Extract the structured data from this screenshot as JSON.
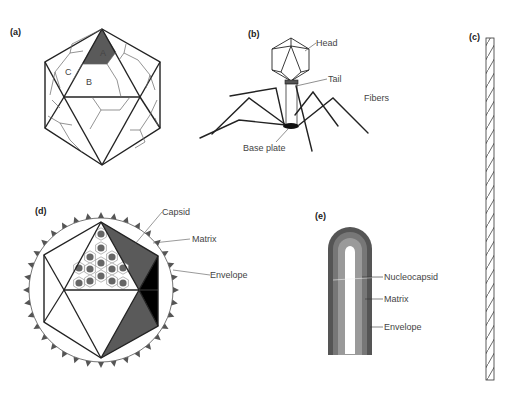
{
  "figure": {
    "panels": [
      {
        "id": "a",
        "label": "(a)",
        "caption": "Icosahedral capsid",
        "face_labels": [
          "A",
          "B",
          "C"
        ]
      },
      {
        "id": "b",
        "label": "(b)",
        "caption": "Bacteriophage",
        "parts": [
          "Head",
          "Tail",
          "Fibers",
          "Base plate"
        ]
      },
      {
        "id": "c",
        "label": "(c)",
        "caption": "Helical rod"
      },
      {
        "id": "d",
        "label": "(d)",
        "caption": "Enveloped icosahedral virus",
        "parts": [
          "Capsid",
          "Matrix",
          "Envelope"
        ]
      },
      {
        "id": "e",
        "label": "(e)",
        "caption": "Enveloped helical virus",
        "parts": [
          "Nucleocapsid",
          "Matrix",
          "Envelope"
        ]
      }
    ],
    "colors": {
      "line": "#222222",
      "capsomer_light": "#8a8a8a",
      "face_dark": "#5a5a5a",
      "face_black": "#000000",
      "envelope_outer": "#555555",
      "matrix_band": "#777777",
      "nucleocapsid_band": "#9a9a9a",
      "core": "#ffffff"
    }
  }
}
